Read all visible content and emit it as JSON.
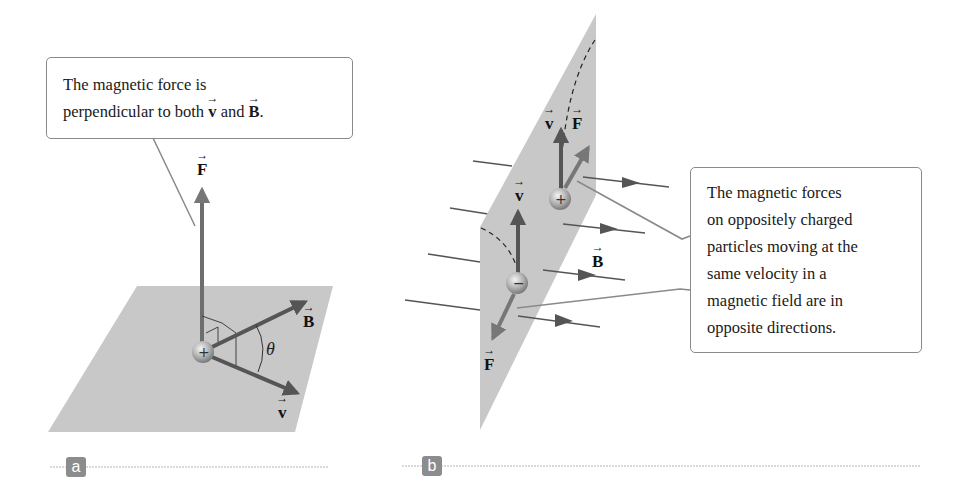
{
  "panel_a": {
    "tag": "a",
    "callout": {
      "line1": "The magnetic force is",
      "line2_prefix": "perpendicular to both ",
      "line2_v": "v",
      "line2_mid": " and ",
      "line2_B": "B",
      "line2_suffix": "."
    },
    "labels": {
      "F": "F",
      "B": "B",
      "v": "v",
      "theta": "θ"
    },
    "charge": "+"
  },
  "panel_b": {
    "tag": "b",
    "callout": {
      "lines": [
        "The magnetic forces",
        "on oppositely charged",
        "particles moving at the",
        "same velocity in a",
        "magnetic field are in",
        "opposite directions."
      ]
    },
    "labels": {
      "v_top": "v",
      "F_top": "F",
      "v_bottom": "v",
      "F_bottom": "F",
      "B": "B"
    },
    "charge_positive": "+",
    "charge_negative": "−"
  },
  "colors": {
    "plane": "#c8c8c8",
    "arrow": "#5a5a5a",
    "arrow_light": "#777777",
    "field_line": "#555555",
    "callout_border": "#8a8a8a",
    "tag_bg": "#8c8c8c",
    "rule": "#b5b5b5"
  }
}
